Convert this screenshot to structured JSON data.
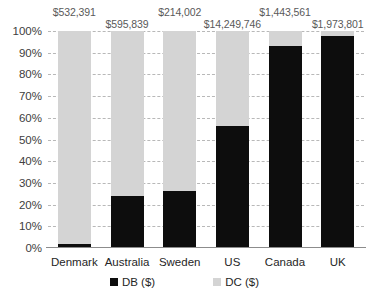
{
  "chart_data": {
    "type": "bar",
    "subtype": "stacked-100-percent",
    "title": "",
    "xlabel": "",
    "ylabel": "",
    "ylim": [
      0,
      100
    ],
    "ytick_labels": [
      "100%",
      "90%",
      "80%",
      "70%",
      "60%",
      "50%",
      "40%",
      "30%",
      "20%",
      "10%",
      "0%"
    ],
    "ytick_values": [
      100,
      90,
      80,
      70,
      60,
      50,
      40,
      30,
      20,
      10,
      0
    ],
    "grid": true,
    "legend_position": "bottom",
    "categories": [
      "Denmark",
      "Australia",
      "Sweden",
      "US",
      "Canada",
      "UK"
    ],
    "series": [
      {
        "name": "DB ($)",
        "color": "#0d0d0d",
        "values": [
          2,
          24,
          26.5,
          56,
          93,
          97.5
        ]
      },
      {
        "name": "DC ($)",
        "color": "#d4d4d4",
        "values": [
          98,
          76,
          73.5,
          44,
          7,
          2.5
        ]
      }
    ],
    "point_labels": [
      "$532,391",
      "$595,839",
      "$214,002",
      "$14,249,746",
      "$1,443,561",
      "$1,973,801"
    ]
  },
  "colors": {
    "db": "#0d0d0d",
    "dc": "#d4d4d4",
    "gridline": "#b8b8b8",
    "axis": "#8c8c8c",
    "label_text": "#595959",
    "tick_text": "#404040"
  }
}
